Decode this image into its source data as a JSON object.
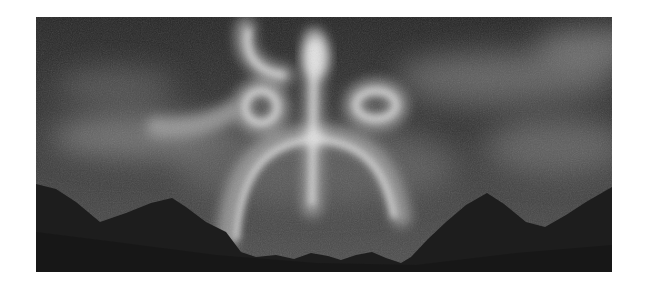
{
  "image": {
    "subject": "aurora glow forming a figure-like glyph above mountain silhouettes",
    "style": "grayscale",
    "colors": {
      "page_background": "#ffffff",
      "sky_dark": "#2a2a2a",
      "sky_mid": "#4a4a4a",
      "glow": "#d8d8d8",
      "mountains": "#1c1c1c"
    }
  }
}
